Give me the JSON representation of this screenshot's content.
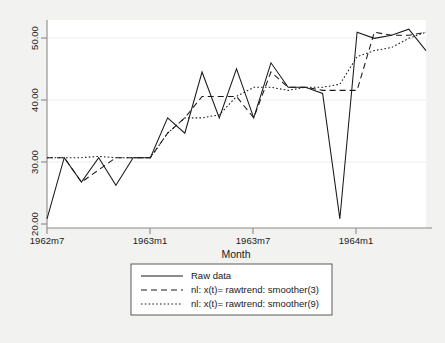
{
  "chart_data": {
    "type": "line",
    "title": "",
    "subtitle": "",
    "xlabel": "Month",
    "ylabel": "",
    "grid": true,
    "legend_position": "bottom",
    "xlim": [
      1962.5,
      1964.4167
    ],
    "ylim": [
      18.5,
      52.5
    ],
    "y_ticks": [
      20,
      30,
      40,
      50
    ],
    "y_tick_labels": [
      "20.00",
      "30.00",
      "40.00",
      "50.00"
    ],
    "x_ticks": [
      1962.5,
      1963.0,
      1963.5,
      1964.0
    ],
    "x_tick_labels": [
      "1962m7",
      "1963m1",
      "1963m7",
      "1964m1"
    ],
    "x": [
      "1962m7",
      "1962m8",
      "1962m9",
      "1962m10",
      "1962m11",
      "1962m12",
      "1963m1",
      "1963m2",
      "1963m3",
      "1963m4",
      "1963m5",
      "1963m6",
      "1963m7",
      "1963m8",
      "1963m9",
      "1963m10",
      "1963m11",
      "1963m12",
      "1964m1",
      "1964m2",
      "1964m3",
      "1964m4",
      "1964m5"
    ],
    "series": [
      {
        "name": "Raw data",
        "style": "solid",
        "values": [
          20.0,
          30.0,
          26.0,
          30.0,
          25.5,
          30.0,
          30.0,
          36.5,
          34.0,
          44.0,
          36.5,
          44.5,
          36.5,
          45.5,
          41.5,
          41.5,
          40.5,
          20.0,
          50.5,
          49.5,
          50.0,
          51.0,
          47.5
        ]
      },
      {
        "name": "nl: x(t)= rawtrend: smoother(3)",
        "style": "dashed",
        "values": [
          30.0,
          30.0,
          26.0,
          28.0,
          30.0,
          30.0,
          30.0,
          34.0,
          36.5,
          40.0,
          40.0,
          40.0,
          36.5,
          44.0,
          41.5,
          41.5,
          41.0,
          41.0,
          41.0,
          50.5,
          50.0,
          50.0,
          50.5
        ]
      },
      {
        "name": "nl: x(t)= rawtrend: smoother(9)",
        "style": "dotted",
        "values": [
          30.0,
          30.0,
          30.0,
          30.2,
          30.0,
          30.0,
          30.0,
          34.0,
          36.5,
          36.5,
          37.0,
          40.0,
          41.5,
          41.5,
          41.0,
          41.5,
          41.5,
          42.0,
          46.5,
          47.5,
          48.0,
          49.5,
          50.5
        ]
      }
    ]
  },
  "axis": {
    "x_title": "Month",
    "y_tick_labels": [
      "50.00",
      "40.00",
      "30.00",
      "20.00"
    ],
    "x_tick_labels": [
      "1962m7",
      "1963m1",
      "1963m7",
      "1964m1"
    ]
  },
  "legend": {
    "items": [
      {
        "label": "Raw data",
        "key": "legend-key-raw"
      },
      {
        "label": "nl: x(t)= rawtrend: smoother(3)",
        "key": "legend-key-smoother3"
      },
      {
        "label": "nl: x(t)= rawtrend: smoother(9)",
        "key": "legend-key-smoother9"
      }
    ]
  },
  "colors": {
    "background": "#f2f2f0",
    "plot_area": "#ffffff",
    "line": "#1a1a1a",
    "grid": "#e8e8e8",
    "axis": "#8a8a8a"
  }
}
